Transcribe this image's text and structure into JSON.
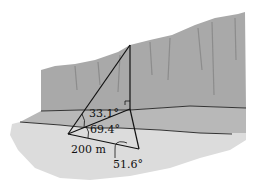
{
  "diagram": {
    "labels": {
      "angle_top": "33.1°",
      "angle_middle": "69.4°",
      "angle_bottom": "51.6°",
      "baseline_length": "200 m"
    },
    "colors": {
      "cliff": "#a9a9a9",
      "cliff_dark": "#8c8c8c",
      "ledge": "#b5b5b5",
      "ground": "#d9d9d9",
      "line": "#111111",
      "background": "#ffffff"
    }
  }
}
